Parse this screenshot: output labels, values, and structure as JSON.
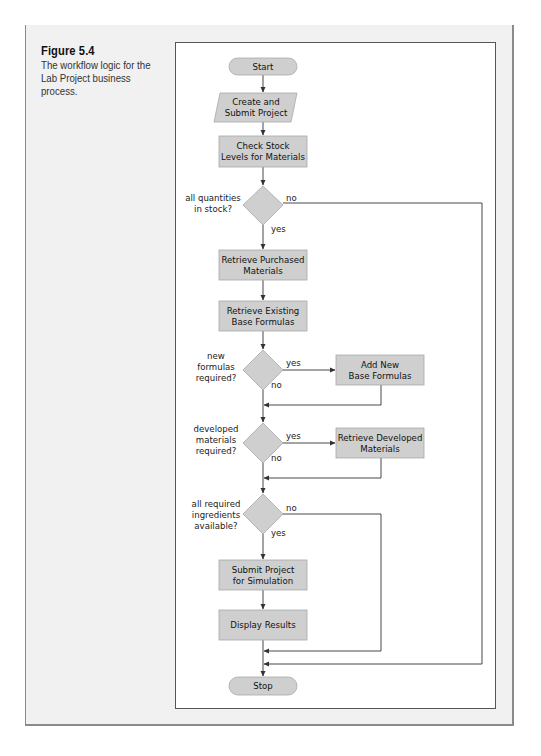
{
  "figure": {
    "title": "Figure 5.4",
    "description": "The workflow logic for the Lab Project business process."
  },
  "flowchart": {
    "nodes": {
      "start": {
        "type": "terminator",
        "lines": [
          "Start"
        ]
      },
      "create_submit": {
        "type": "input-output",
        "lines": [
          "Create and",
          "Submit Project"
        ]
      },
      "check_stock": {
        "type": "process",
        "lines": [
          "Check Stock",
          "Levels for Materials"
        ]
      },
      "decision_stock": {
        "type": "decision",
        "lines": [
          "all quantities",
          "in stock?"
        ]
      },
      "retrieve_purchased": {
        "type": "process",
        "lines": [
          "Retrieve Purchased",
          "Materials"
        ]
      },
      "retrieve_existing": {
        "type": "process",
        "lines": [
          "Retrieve Existing",
          "Base Formulas"
        ]
      },
      "decision_formulas": {
        "type": "decision",
        "lines": [
          "new",
          "formulas",
          "required?"
        ]
      },
      "add_new": {
        "type": "process",
        "lines": [
          "Add New",
          "Base Formulas"
        ]
      },
      "decision_developed": {
        "type": "decision",
        "lines": [
          "developed",
          "materials",
          "required?"
        ]
      },
      "retrieve_developed": {
        "type": "process",
        "lines": [
          "Retrieve Developed",
          "Materials"
        ]
      },
      "decision_ingredients": {
        "type": "decision",
        "lines": [
          "all required",
          "ingredients",
          "available?"
        ]
      },
      "submit_simulation": {
        "type": "process",
        "lines": [
          "Submit Project",
          "for Simulation"
        ]
      },
      "display_results": {
        "type": "process",
        "lines": [
          "Display Results"
        ]
      },
      "stop": {
        "type": "terminator",
        "lines": [
          "Stop"
        ]
      }
    },
    "branch_labels": {
      "yes": "yes",
      "no": "no"
    },
    "edges": [
      {
        "from": "start",
        "to": "create_submit"
      },
      {
        "from": "create_submit",
        "to": "check_stock"
      },
      {
        "from": "check_stock",
        "to": "decision_stock"
      },
      {
        "from": "decision_stock",
        "to": "retrieve_purchased",
        "label": "yes"
      },
      {
        "from": "decision_stock",
        "to": "stop",
        "label": "no"
      },
      {
        "from": "retrieve_purchased",
        "to": "retrieve_existing"
      },
      {
        "from": "retrieve_existing",
        "to": "decision_formulas"
      },
      {
        "from": "decision_formulas",
        "to": "add_new",
        "label": "yes"
      },
      {
        "from": "decision_formulas",
        "to": "decision_developed",
        "label": "no"
      },
      {
        "from": "add_new",
        "to": "decision_developed"
      },
      {
        "from": "decision_developed",
        "to": "retrieve_developed",
        "label": "yes"
      },
      {
        "from": "decision_developed",
        "to": "decision_ingredients",
        "label": "no"
      },
      {
        "from": "retrieve_developed",
        "to": "decision_ingredients"
      },
      {
        "from": "decision_ingredients",
        "to": "submit_simulation",
        "label": "yes"
      },
      {
        "from": "decision_ingredients",
        "to": "stop",
        "label": "no"
      },
      {
        "from": "submit_simulation",
        "to": "display_results"
      },
      {
        "from": "display_results",
        "to": "stop"
      }
    ]
  }
}
